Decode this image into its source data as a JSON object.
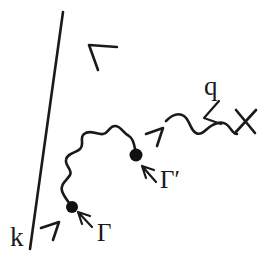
{
  "figure": {
    "kind": "feynman-diagram",
    "background_color": "#ffffff",
    "ink_color": "#1a1a1a"
  },
  "labels": {
    "incoming_momentum": "k",
    "photon_momentum": "q",
    "bare_vertex": "Γ",
    "dressed_vertex": "Γ′"
  },
  "elements": {
    "fermion_line_name": "fermion-propagator-line",
    "internal_photon_name": "internal-photon-wavy-line",
    "external_photon_name": "external-photon-wavy-line",
    "cross_name": "external-source-cross",
    "lower_vertex_name": "vertex-dot-gamma",
    "upper_vertex_name": "vertex-dot-gamma-prime"
  }
}
